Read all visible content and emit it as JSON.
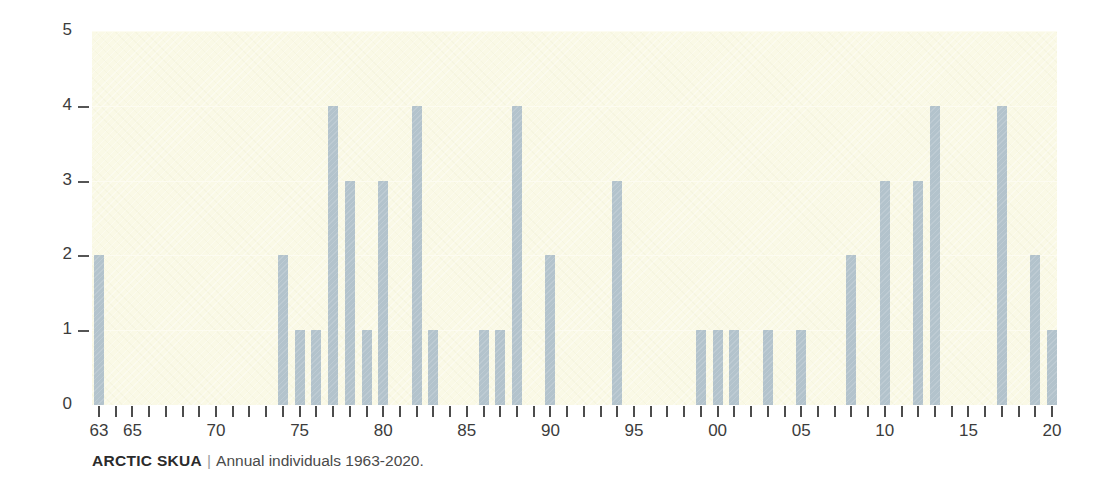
{
  "caption": {
    "title": "ARCTIC SKUA",
    "separator": "|",
    "subtitle": "Annual individuals 1963-2020."
  },
  "axis": {
    "y_ticks": [
      "0",
      "1",
      "2",
      "3",
      "4",
      "5"
    ],
    "x_tick_labels": [
      {
        "year": 1963,
        "text": "63"
      },
      {
        "year": 1965,
        "text": "65"
      },
      {
        "year": 1970,
        "text": "70"
      },
      {
        "year": 1975,
        "text": "75"
      },
      {
        "year": 1980,
        "text": "80"
      },
      {
        "year": 1985,
        "text": "85"
      },
      {
        "year": 1990,
        "text": "90"
      },
      {
        "year": 1995,
        "text": "95"
      },
      {
        "year": 2000,
        "text": "00"
      },
      {
        "year": 2005,
        "text": "05"
      },
      {
        "year": 2010,
        "text": "10"
      },
      {
        "year": 2015,
        "text": "15"
      },
      {
        "year": 2020,
        "text": "20"
      }
    ]
  },
  "colors": {
    "bar": "#b3c3cc",
    "plot_background": "#faf9e6",
    "gridline": "#fdfcf1",
    "axis_text": "#3c3c3c",
    "page_background": "#ffffff"
  },
  "chart_data": {
    "type": "bar",
    "title": "ARCTIC SKUA",
    "subtitle": "Annual individuals 1963-2020.",
    "xlabel": "",
    "ylabel": "",
    "ylim": [
      0,
      5
    ],
    "grid": true,
    "legend": "none",
    "categories": [
      1963,
      1964,
      1965,
      1966,
      1967,
      1968,
      1969,
      1970,
      1971,
      1972,
      1973,
      1974,
      1975,
      1976,
      1977,
      1978,
      1979,
      1980,
      1981,
      1982,
      1983,
      1984,
      1985,
      1986,
      1987,
      1988,
      1989,
      1990,
      1991,
      1992,
      1993,
      1994,
      1995,
      1996,
      1997,
      1998,
      1999,
      2000,
      2001,
      2002,
      2003,
      2004,
      2005,
      2006,
      2007,
      2008,
      2009,
      2010,
      2011,
      2012,
      2013,
      2014,
      2015,
      2016,
      2017,
      2018,
      2019,
      2020
    ],
    "values": [
      2,
      0,
      0,
      0,
      0,
      0,
      0,
      0,
      0,
      0,
      0,
      2,
      1,
      1,
      4,
      3,
      1,
      3,
      0,
      4,
      1,
      0,
      0,
      1,
      1,
      4,
      0,
      2,
      0,
      0,
      0,
      3,
      0,
      0,
      0,
      0,
      1,
      1,
      1,
      0,
      1,
      0,
      1,
      0,
      0,
      2,
      0,
      3,
      0,
      3,
      4,
      0,
      0,
      0,
      4,
      0,
      2,
      1
    ]
  }
}
